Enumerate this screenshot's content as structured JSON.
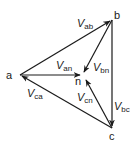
{
  "diagram": {
    "type": "phasor-triangle",
    "nodes": {
      "a": {
        "label": "a"
      },
      "b": {
        "label": "b"
      },
      "c": {
        "label": "c"
      },
      "n": {
        "label": "n"
      }
    },
    "vectors": {
      "ab": {
        "main": "V",
        "sub": "ab",
        "from": "a",
        "to": "b"
      },
      "bc": {
        "main": "V",
        "sub": "bc",
        "from": "b",
        "to": "c"
      },
      "ca": {
        "main": "V",
        "sub": "ca",
        "from": "c",
        "to": "a"
      },
      "an": {
        "main": "V",
        "sub": "an",
        "from": "a",
        "to": "n"
      },
      "bn": {
        "main": "V",
        "sub": "bn",
        "from": "b",
        "to": "n"
      },
      "cn": {
        "main": "V",
        "sub": "cn",
        "from": "c",
        "to": "n"
      }
    },
    "colors": {
      "line": "#1a1a1a",
      "background": "#ffffff"
    }
  }
}
